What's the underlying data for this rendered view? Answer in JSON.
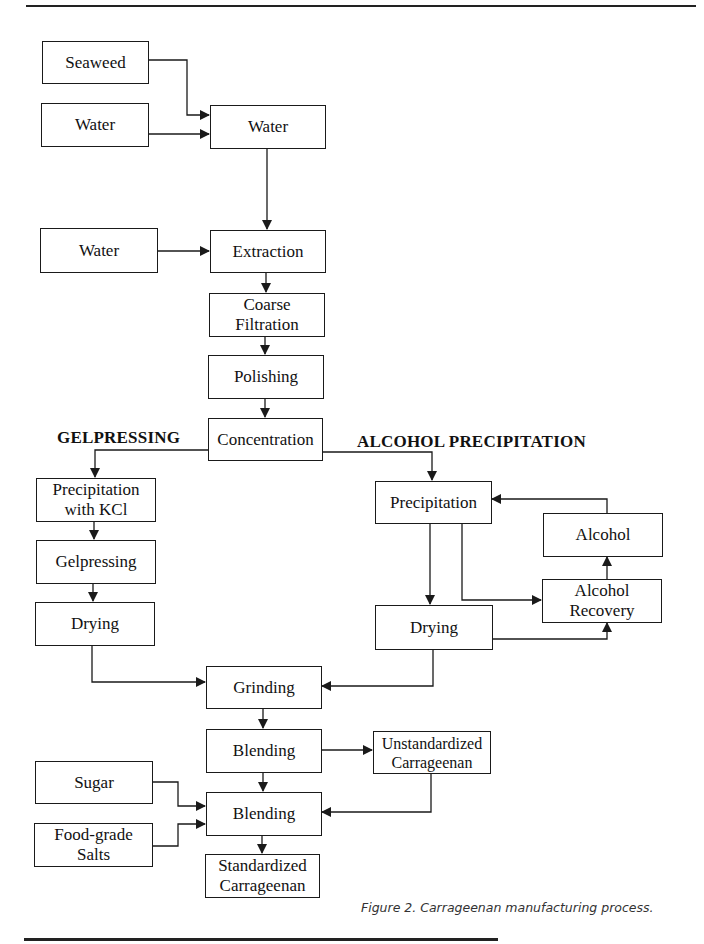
{
  "figure": {
    "caption": "Figure 2. Carrageenan manufacturing process.",
    "section_labels": {
      "gelpressing": "GELPRESSING",
      "alcohol_precipitation": "ALCOHOL PRECIPITATION"
    },
    "nodes": {
      "seaweed": "Seaweed",
      "water_input_1": "Water",
      "water_mix": "Water",
      "water_input_2": "Water",
      "extraction": "Extraction",
      "coarse_filtration": [
        "Coarse",
        "Filtration"
      ],
      "polishing": "Polishing",
      "concentration": "Concentration",
      "precipitation_kcl": [
        "Precipitation",
        "with KCl"
      ],
      "gelpressing": "Gelpressing",
      "drying_gel": "Drying",
      "precipitation_alcohol": "Precipitation",
      "alcohol": "Alcohol",
      "alcohol_recovery": [
        "Alcohol",
        "Recovery"
      ],
      "drying_alcohol": "Drying",
      "grinding": "Grinding",
      "blending_1": "Blending",
      "unstandardized": [
        "Unstandardized",
        "Carrageenan"
      ],
      "sugar": "Sugar",
      "blending_2": "Blending",
      "food_grade_salts": [
        "Food-grade",
        "Salts"
      ],
      "standardized": [
        "Standardized",
        "Carrageenan"
      ]
    },
    "edges": [
      [
        "Seaweed",
        "Water (mix)"
      ],
      [
        "Water (input)",
        "Water (mix)"
      ],
      [
        "Water (mix)",
        "Extraction"
      ],
      [
        "Water (input 2)",
        "Extraction"
      ],
      [
        "Extraction",
        "Coarse Filtration"
      ],
      [
        "Coarse Filtration",
        "Polishing"
      ],
      [
        "Polishing",
        "Concentration"
      ],
      [
        "Concentration",
        "Precipitation with KCl"
      ],
      [
        "Concentration",
        "Precipitation"
      ],
      [
        "Precipitation with KCl",
        "Gelpressing"
      ],
      [
        "Gelpressing",
        "Drying (gel)"
      ],
      [
        "Drying (gel)",
        "Grinding"
      ],
      [
        "Precipitation",
        "Drying (alcohol)"
      ],
      [
        "Precipitation",
        "Alcohol Recovery"
      ],
      [
        "Drying (alcohol)",
        "Alcohol Recovery"
      ],
      [
        "Alcohol Recovery",
        "Alcohol"
      ],
      [
        "Alcohol",
        "Precipitation"
      ],
      [
        "Drying (alcohol)",
        "Grinding"
      ],
      [
        "Grinding",
        "Blending 1"
      ],
      [
        "Blending 1",
        "Unstandardized Carrageenan"
      ],
      [
        "Blending 1",
        "Blending 2"
      ],
      [
        "Unstandardized Carrageenan",
        "Blending 2"
      ],
      [
        "Sugar",
        "Blending 2"
      ],
      [
        "Food-grade Salts",
        "Blending 2"
      ],
      [
        "Blending 2",
        "Standardized Carrageenan"
      ]
    ]
  }
}
